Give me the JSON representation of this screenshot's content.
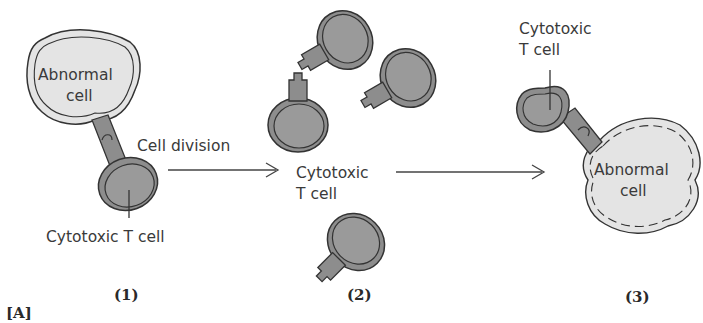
{
  "figure": {
    "panel_label": "[A]",
    "steps": [
      {
        "number": "(1)",
        "labels": {
          "abnormal_line1": "Abnormal",
          "abnormal_line2": "cell",
          "process": "Cell division",
          "tcell": "Cytotoxic T cell"
        }
      },
      {
        "number": "(2)",
        "labels": {
          "tcell_line1": "Cytotoxic",
          "tcell_line2": "T cell"
        }
      },
      {
        "number": "(3)",
        "labels": {
          "tcell_line1": "Cytotoxic",
          "tcell_line2": "T cell",
          "abnormal_line1": "Abnormal",
          "abnormal_line2": "cell"
        }
      }
    ],
    "colors": {
      "abnormal_fill": "#e4e4e4",
      "tcell_fill": "#8d8d8d",
      "tcell_inner": "#9a9a9a",
      "outline": "#3a3a3a"
    }
  }
}
